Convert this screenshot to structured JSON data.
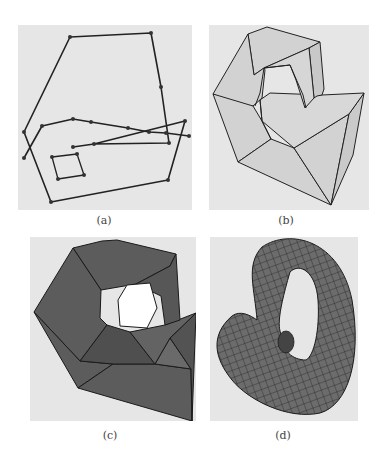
{
  "figure": {
    "panels": [
      {
        "id": "a",
        "caption": "(a)",
        "description": "Control polygon with vertices on gray background"
      },
      {
        "id": "b",
        "caption": "(b)",
        "description": "Light-shaded polyhedral mesh with edges"
      },
      {
        "id": "c",
        "caption": "(c)",
        "description": "Dark-shaded polyhedral mesh"
      },
      {
        "id": "d",
        "caption": "(d)",
        "description": "Smooth subdivided knotted torus surface with grid lines"
      }
    ],
    "colors": {
      "background": "#e6e6e6",
      "line": "#222222",
      "light_face": "#d4d4d4",
      "dark_face": "#5a5a5a",
      "surface": "#6e6e6e"
    }
  }
}
